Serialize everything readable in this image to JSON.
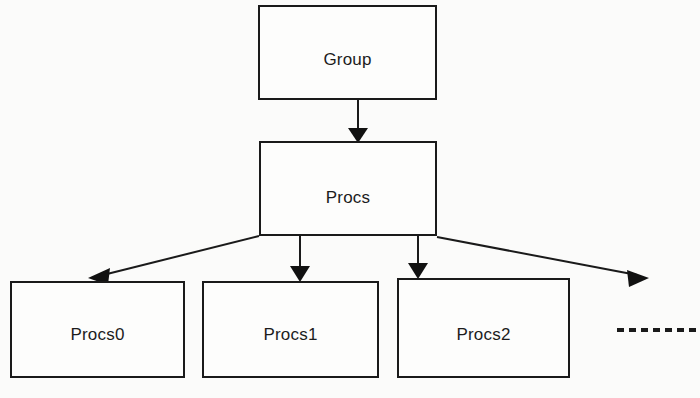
{
  "diagram": {
    "type": "tree-hierarchy",
    "background_color": "#fbfbfa",
    "line_color": "#1a1a1a",
    "text_color": "#1c1c1c",
    "nodes": [
      {
        "id": "group",
        "label": "Group",
        "level": 0,
        "x": 258,
        "y": 5,
        "width": 179,
        "height": 95,
        "label_x": 348,
        "label_y": 48
      },
      {
        "id": "procs",
        "label": "Procs",
        "level": 1,
        "x": 259,
        "y": 141,
        "width": 178,
        "height": 95,
        "label_x": 348,
        "label_y": 186
      },
      {
        "id": "procs0",
        "label": "Procs0",
        "level": 2,
        "x": 10,
        "y": 281,
        "width": 175,
        "height": 97,
        "label_x": 97,
        "label_y": 323
      },
      {
        "id": "procs1",
        "label": "Procs1",
        "level": 2,
        "x": 202,
        "y": 281,
        "width": 177,
        "height": 97,
        "label_x": 290,
        "label_y": 323
      },
      {
        "id": "procs2",
        "label": "Procs2",
        "level": 2,
        "x": 397,
        "y": 278,
        "width": 173,
        "height": 100,
        "label_x": 483,
        "label_y": 323
      }
    ],
    "edges": [
      {
        "id": "group-to-procs",
        "from": "group",
        "to": "procs",
        "style": "solid",
        "arrow": "end"
      },
      {
        "id": "procs-to-procs0",
        "from": "procs",
        "to": "procs0",
        "style": "solid",
        "arrow": "end"
      },
      {
        "id": "procs-to-procs1",
        "from": "procs",
        "to": "procs1",
        "style": "solid",
        "arrow": "end"
      },
      {
        "id": "procs-to-procs2",
        "from": "procs",
        "to": "procs2",
        "style": "solid",
        "arrow": "end"
      },
      {
        "id": "procs-to-more",
        "from": "procs",
        "to": "continuation",
        "style": "solid",
        "arrow": "end"
      }
    ],
    "continuation": {
      "label": "",
      "style": "dashed",
      "x1": 617,
      "y1": 330,
      "x2": 697,
      "y2": 330
    }
  }
}
